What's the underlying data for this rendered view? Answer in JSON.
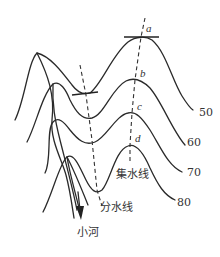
{
  "diagram": {
    "type": "contour-map",
    "contours": [
      {
        "elevation_label": "50"
      },
      {
        "elevation_label": "60"
      },
      {
        "elevation_label": "70"
      },
      {
        "elevation_label": "80"
      }
    ],
    "points": [
      {
        "label": "a"
      },
      {
        "label": "b"
      },
      {
        "label": "c"
      },
      {
        "label": "d"
      }
    ],
    "lines": {
      "valley_line_label": "集水线",
      "ridge_line_label": "分水线"
    },
    "river": {
      "label": "小河"
    }
  }
}
